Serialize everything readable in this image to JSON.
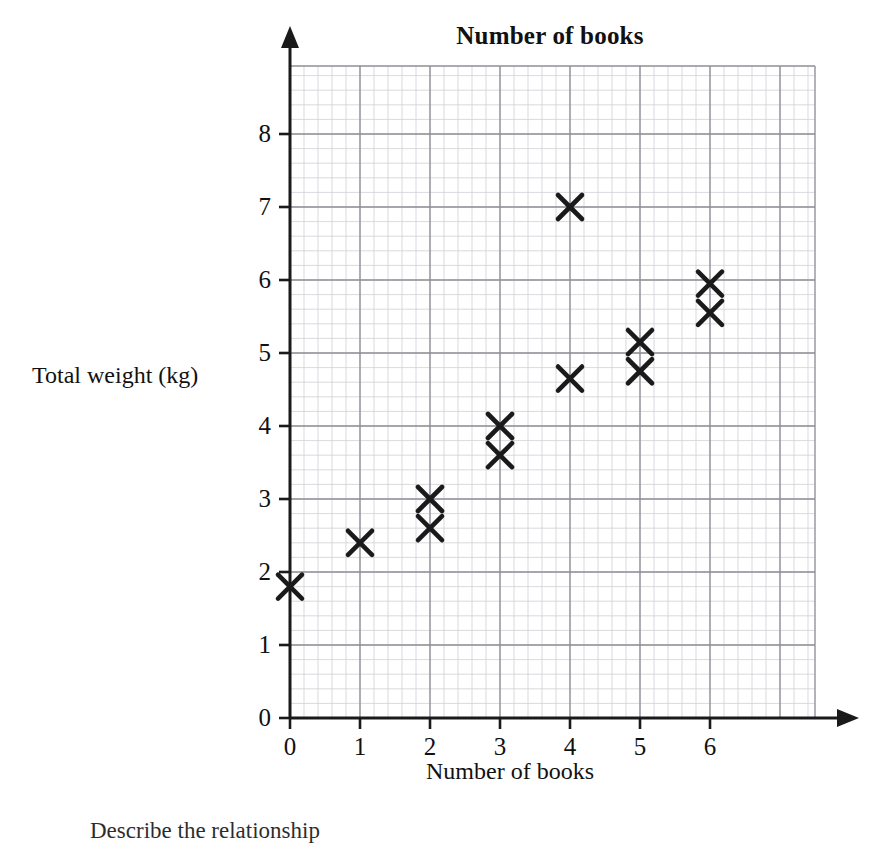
{
  "figure": {
    "title": "Number of books",
    "x_caption": "Number of books",
    "y_caption": "Total weight (kg)",
    "footer_note": "Describe the relationship"
  },
  "chart_data": {
    "type": "scatter",
    "title": "Number of books",
    "xlabel": "Number of books",
    "ylabel": "Total weight (kg)",
    "xlim": [
      0,
      7.5
    ],
    "ylim": [
      0,
      8.9
    ],
    "xticks": [
      "0",
      "1",
      "2",
      "3",
      "4",
      "5",
      "6"
    ],
    "yticks": [
      "0",
      "1",
      "2",
      "3",
      "4",
      "5",
      "6",
      "7",
      "8"
    ],
    "grid": true,
    "minor_grid": true,
    "minor_per_major": 5,
    "legend": null,
    "marker": "x-cross",
    "marker_color": "#1a1a1a",
    "points": [
      {
        "x": 0,
        "y": 1.8
      },
      {
        "x": 1,
        "y": 2.4
      },
      {
        "x": 2,
        "y": 3.0
      },
      {
        "x": 2,
        "y": 2.6
      },
      {
        "x": 3,
        "y": 4.0
      },
      {
        "x": 3,
        "y": 3.6
      },
      {
        "x": 4,
        "y": 7.0
      },
      {
        "x": 4,
        "y": 4.65
      },
      {
        "x": 5,
        "y": 5.15
      },
      {
        "x": 5,
        "y": 4.75
      },
      {
        "x": 6,
        "y": 5.95
      },
      {
        "x": 6,
        "y": 5.55
      }
    ]
  },
  "colors": {
    "ink": "#1a1a1a",
    "grid_major": "#8e8e96",
    "grid_minor": "#cfcfd6",
    "background": "#ffffff"
  }
}
